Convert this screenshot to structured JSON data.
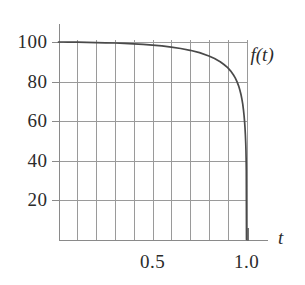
{
  "chart_data": {
    "type": "line",
    "title": "",
    "subtitle": "",
    "xlabel": "t",
    "ylabel": "f(t)",
    "ylabel_position": "curve-end-top-right",
    "xlim": [
      0.0,
      1.06
    ],
    "ylim": [
      0,
      108
    ],
    "grid": true,
    "grid_color": "#9a9a9a",
    "legend": null,
    "axis_color": "#8a8a8a",
    "line_color": "#4a4a4a",
    "x_ticks_labeled": [
      "0.5",
      "1.0"
    ],
    "x_tick_values_labeled": [
      0.5,
      1.0
    ],
    "x_gridline_values": [
      0.0,
      0.1,
      0.2,
      0.3,
      0.4,
      0.5,
      0.6,
      0.7,
      0.8,
      0.9,
      1.0
    ],
    "y_ticks_labeled": [
      "20",
      "40",
      "60",
      "80",
      "100"
    ],
    "y_tick_values_labeled": [
      20,
      40,
      60,
      80,
      100
    ],
    "y_gridline_values": [
      20,
      40,
      60,
      80,
      100
    ],
    "series": [
      {
        "name": "f(t)",
        "color": "#4a4a4a",
        "x": [
          0.0,
          0.025,
          0.05,
          0.075,
          0.1,
          0.15,
          0.2,
          0.25,
          0.3,
          0.35,
          0.4,
          0.45,
          0.5,
          0.55,
          0.6,
          0.65,
          0.7,
          0.75,
          0.8,
          0.83,
          0.86,
          0.88,
          0.9,
          0.915,
          0.93,
          0.94,
          0.95,
          0.958,
          0.965,
          0.971,
          0.976,
          0.98,
          0.984,
          0.987,
          0.99,
          0.992,
          0.994,
          0.996,
          0.997,
          0.998,
          0.999,
          1.0
        ],
        "y": [
          100.0,
          100.0,
          99.9,
          99.9,
          99.9,
          99.8,
          99.7,
          99.6,
          99.5,
          99.3,
          99.1,
          98.8,
          98.4,
          98.0,
          97.4,
          96.7,
          95.8,
          94.6,
          92.9,
          91.6,
          90.0,
          88.6,
          87.0,
          85.4,
          83.4,
          81.8,
          79.8,
          77.8,
          75.6,
          73.3,
          70.8,
          68.5,
          65.5,
          62.8,
          59.4,
          56.6,
          53.2,
          48.6,
          45.4,
          41.2,
          34.5,
          0.0
        ]
      }
    ],
    "annotations": []
  },
  "axes": {
    "x_axis_name": "t",
    "y_curve_name": "f(t)"
  }
}
